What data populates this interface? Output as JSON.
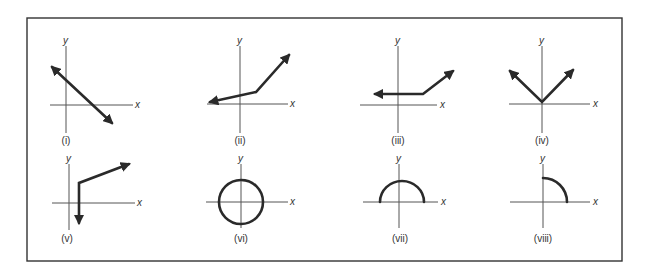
{
  "figure": {
    "axis_labels": {
      "x": "x",
      "y": "y"
    },
    "colors": {
      "curve": "#2a2a2a",
      "axis": "#555555",
      "frame": "#333333",
      "background": "#ffffff"
    },
    "panels": [
      {
        "id": "i",
        "caption": "(i)",
        "shape": "straight line, negative slope, arrows both ends"
      },
      {
        "id": "ii",
        "caption": "(ii)",
        "shape": "polyline: shallow segment then steep segment, arrows both ends"
      },
      {
        "id": "iii",
        "caption": "(iii)",
        "shape": "polyline: horizontal segment then rising segment, arrows both ends"
      },
      {
        "id": "iv",
        "caption": "(iv)",
        "shape": "V shape with vertex at origin, arrows both ends"
      },
      {
        "id": "v",
        "caption": "(v)",
        "shape": "vertical ray downward joined to rising ray, arrows both ends"
      },
      {
        "id": "vi",
        "caption": "(vi)",
        "shape": "circle centered at origin"
      },
      {
        "id": "vii",
        "caption": "(vii)",
        "shape": "upper semicircle centered at origin"
      },
      {
        "id": "viii",
        "caption": "(viii)",
        "shape": "quarter circle in first quadrant"
      }
    ]
  }
}
